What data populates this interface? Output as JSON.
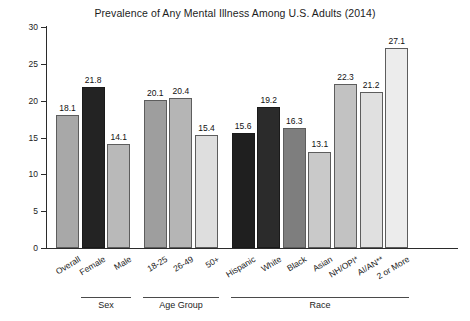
{
  "chart_data": {
    "type": "bar",
    "title": "Prevalence of Any Mental Illness Among U.S. Adults (2014)",
    "xlabel": "",
    "ylabel": "Percent",
    "ylim": [
      0,
      30
    ],
    "yticks": [
      0,
      5,
      10,
      15,
      20,
      25,
      30
    ],
    "grid": false,
    "legend": "none",
    "categories": [
      "Overall",
      "Female",
      "Male",
      "18-25",
      "26-49",
      "50+",
      "Hispanic",
      "White",
      "Black",
      "Asian",
      "NH/OPI*",
      "AI/AN**",
      "2 or More"
    ],
    "values": [
      18.1,
      21.8,
      14.1,
      20.1,
      20.4,
      15.4,
      15.6,
      19.2,
      16.3,
      13.1,
      22.3,
      21.2,
      27.1
    ],
    "bar_colors": [
      "#a8a8a8",
      "#232323",
      "#b9b9b9",
      "#9e9e9e",
      "#b5b5b5",
      "#dedede",
      "#1f1f1f",
      "#2b2b2b",
      "#7e7e7e",
      "#c9c9c9",
      "#c2c2c2",
      "#e0e0e0",
      "#ececec"
    ],
    "value_labels": [
      "18.1",
      "21.8",
      "14.1",
      "20.1",
      "20.4",
      "15.4",
      "15.6",
      "19.2",
      "16.3",
      "13.1",
      "22.3",
      "21.2",
      "27.1"
    ],
    "groups": [
      {
        "label": "Sex",
        "start": 1,
        "end": 2
      },
      {
        "label": "Age Group",
        "start": 3,
        "end": 5
      },
      {
        "label": "Race",
        "start": 6,
        "end": 12
      }
    ]
  }
}
